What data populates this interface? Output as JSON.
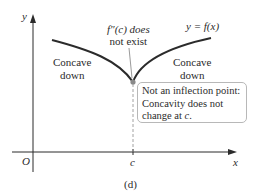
{
  "figure": {
    "panel_label": "(d)",
    "axes": {
      "x_label": "x",
      "y_label": "y",
      "origin_label": "O",
      "x_tick_label": "c"
    },
    "curve_label": "y = f(x)",
    "regions": {
      "left": {
        "line1": "Concave",
        "line2": "down"
      },
      "right": {
        "line1": "Concave",
        "line2": "down"
      }
    },
    "cusp_annotation": {
      "line1": "f″(c) does",
      "line2": "not exist"
    },
    "callout": {
      "line1": "Not an inflection point:",
      "line2": "Concavity does not",
      "line3_prefix": "change at ",
      "line3_var": "c",
      "line3_suffix": "."
    },
    "colors": {
      "curve": "#2b2b2b",
      "axis": "#2b2b2b",
      "point": "#8a8a8a",
      "callout_border": "#b8b8b8",
      "dashed_line": "#8a8a8a"
    }
  }
}
